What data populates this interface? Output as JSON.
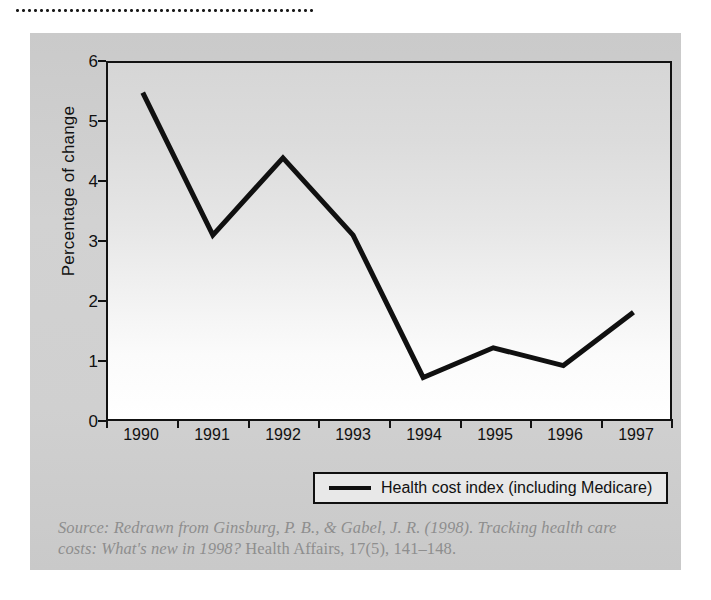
{
  "figure": {
    "divider": "dotted-rule",
    "background_color": "#cfcfcf",
    "line_color": "#101010",
    "plot_background": "#ffffff"
  },
  "chart_data": {
    "type": "line",
    "title": "",
    "xlabel": "",
    "ylabel": "Percentage of change",
    "categories": [
      "1990",
      "1991",
      "1992",
      "1993",
      "1994",
      "1995",
      "1996",
      "1997"
    ],
    "x": [
      1990,
      1991,
      1992,
      1993,
      1994,
      1995,
      1996,
      1997
    ],
    "series": [
      {
        "name": "Health cost index (including Medicare)",
        "values": [
          5.5,
          3.1,
          4.4,
          3.1,
          0.7,
          1.2,
          0.9,
          1.8
        ]
      }
    ],
    "ylim": [
      0,
      6
    ],
    "yticks": [
      0,
      1,
      2,
      3,
      4,
      5,
      6
    ],
    "ytick_labels": [
      "0",
      "1",
      "2",
      "3",
      "4",
      "5",
      "6"
    ],
    "xtick_labels": [
      "1990",
      "1991",
      "1992",
      "1993",
      "1994",
      "1995",
      "1996",
      "1997"
    ],
    "grid": false,
    "legend_position": "below-plot-center",
    "legend_entries": [
      "Health cost index (including Medicare)"
    ]
  },
  "legend": {
    "label": "Health cost index (including Medicare)"
  },
  "source": {
    "line1_italic": "Source: Redrawn from Ginsburg, P. B., & Gabel, J. R. (1998). Tracking",
    "line2_italic": "health care costs: What's new in 1998?",
    "line2_roman": " Health Affairs, 17(5), 141–148."
  }
}
